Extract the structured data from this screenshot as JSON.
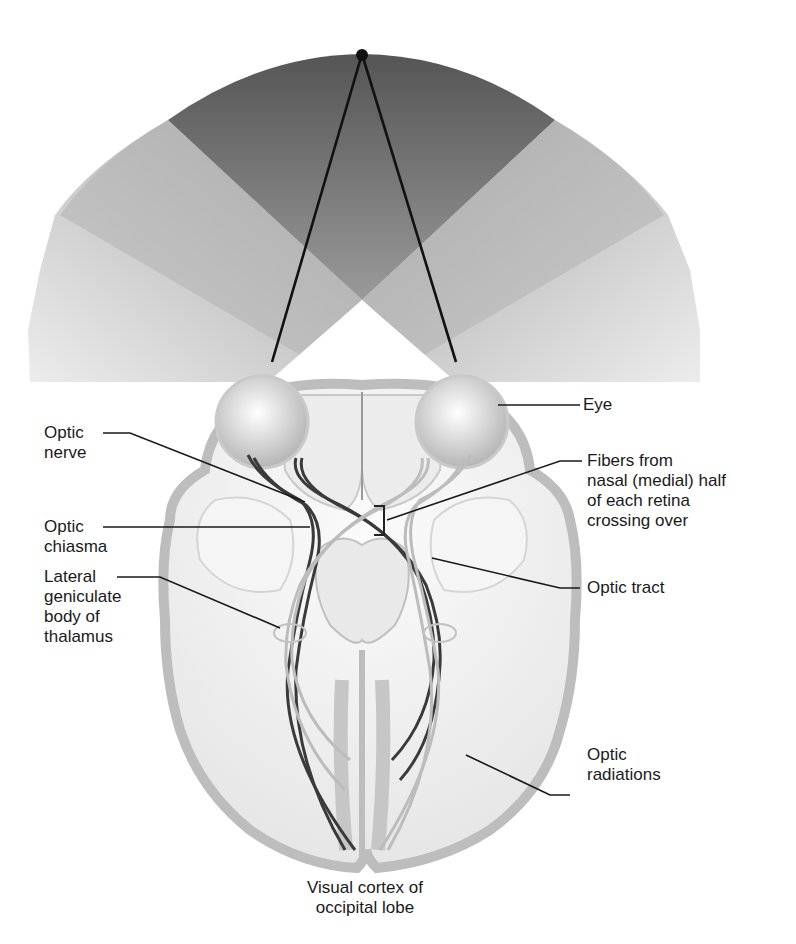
{
  "diagram": {
    "colors": {
      "field_dark": "#555555",
      "field_light": "#d8d8d8",
      "brain_fill": "#f3f3f3",
      "cortex_gray": "#bdbdbd",
      "fiber_dark": "#3a3a3a",
      "fiber_light": "#b9b9b9",
      "leader_line": "#1a1a1a"
    },
    "labels": {
      "eye": "Eye",
      "optic_nerve": "Optic\nnerve",
      "optic_chiasma": "Optic\nchiasma",
      "lateral_geniculate": "Lateral\ngeniculate\nbody of\nthalamus",
      "fibers_crossing": "Fibers from\nnasal (medial) half\nof each retina\ncrossing over",
      "optic_tract": "Optic tract",
      "optic_radiations": "Optic\nradiations",
      "visual_cortex": "Visual cortex of\noccipital lobe"
    }
  }
}
